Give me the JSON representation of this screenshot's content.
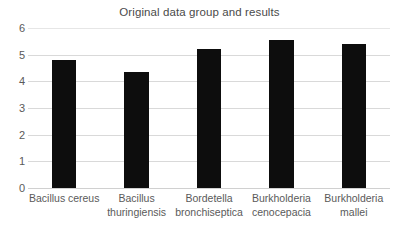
{
  "chart_data": {
    "type": "bar",
    "title": "Original data group and results",
    "xlabel": "",
    "ylabel": "",
    "ylim": [
      0,
      6
    ],
    "yticks": [
      "0",
      "1",
      "2",
      "3",
      "4",
      "5",
      "6"
    ],
    "grid": true,
    "legend": "none",
    "bar_color": "#0d0d0d",
    "gridline_color": "#d9d9d9",
    "text_color": "#5a5a5a",
    "categories": [
      "Bacillus cereus",
      "Bacillus thuringiensis",
      "Bordetella bronchiseptica",
      "Burkholderia cenocepacia",
      "Burkholderia mallei"
    ],
    "category_lines": [
      [
        "Bacillus cereus"
      ],
      [
        "Bacillus",
        "thuringiensis"
      ],
      [
        "Bordetella",
        "bronchiseptica"
      ],
      [
        "Burkholderia",
        "cenocepacia"
      ],
      [
        "Burkholderia",
        "mallei"
      ]
    ],
    "values": [
      4.8,
      4.35,
      5.2,
      5.55,
      5.4
    ]
  }
}
